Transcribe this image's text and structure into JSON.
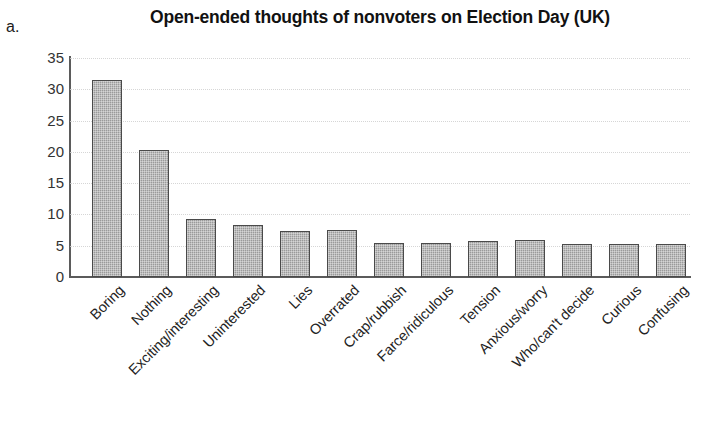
{
  "panel": {
    "letter": "a."
  },
  "chart_data": {
    "type": "bar",
    "title": "Open-ended thoughts of nonvoters on Election Day (UK)",
    "xlabel": "",
    "ylabel": "",
    "ylim": [
      0,
      35
    ],
    "y_ticks": [
      0,
      5,
      10,
      15,
      20,
      25,
      30,
      35
    ],
    "grid": true,
    "legend": "none",
    "bar_color": "#9a9a9a",
    "bar_edge_color": "#4a4a4a",
    "categories": [
      "Boring",
      "Nothing",
      "Exciting/interesting",
      "Uninterested",
      "Lies",
      "Overrated",
      "Crap/rubbish",
      "Farce/ridiculous",
      "Tension",
      "Anxious/worry",
      "Who/can't decide",
      "Curious",
      "Confusing"
    ],
    "values": [
      31.5,
      20.3,
      9.3,
      8.3,
      7.3,
      7.5,
      5.5,
      5.5,
      5.7,
      5.9,
      5.2,
      5.2,
      5.2
    ]
  }
}
